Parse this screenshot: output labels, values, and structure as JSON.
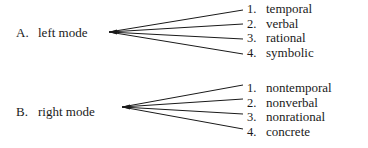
{
  "diagram": {
    "background_color": "#ffffff",
    "line_color": "#1a1a1a",
    "text_color": "#1a1a1a",
    "groups": [
      {
        "id": "group-a",
        "marker": "A.",
        "label": "left mode",
        "branches": [
          {
            "number": "1.",
            "text": "temporal"
          },
          {
            "number": "2.",
            "text": "verbal"
          },
          {
            "number": "3.",
            "text": "rational"
          },
          {
            "number": "4.",
            "text": "symbolic"
          }
        ]
      },
      {
        "id": "group-b",
        "marker": "B.",
        "label": "right mode",
        "branches": [
          {
            "number": "1.",
            "text": "nontemporal"
          },
          {
            "number": "2.",
            "text": "nonverbal"
          },
          {
            "number": "3.",
            "text": "nonrational"
          },
          {
            "number": "4.",
            "text": "concrete"
          }
        ]
      }
    ]
  }
}
